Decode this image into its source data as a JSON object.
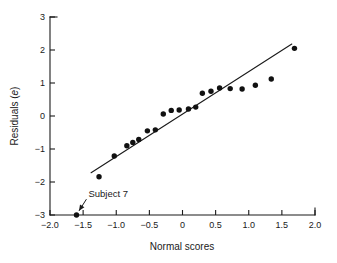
{
  "chart_data": {
    "type": "scatter",
    "title": "",
    "xlabel": "Normal scores",
    "ylabel": "Residuals (e)",
    "ylabel_plain": "Residuals (",
    "ylabel_italic": "e",
    "ylabel_close": ")",
    "xlim": [
      -2.0,
      2.0
    ],
    "ylim": [
      -3,
      3
    ],
    "grid": false,
    "legend": "none",
    "xticks": [
      -2.0,
      -1.5,
      -1.0,
      -0.5,
      0,
      0.5,
      1.0,
      1.5,
      2.0
    ],
    "xtick_labels": [
      "−2.0",
      "−1.5",
      "−1.0",
      "−0.5",
      "0",
      "0.5",
      "1.0",
      "1.5",
      "2.0"
    ],
    "yticks": [
      -3,
      -2,
      -1,
      0,
      1,
      2,
      3
    ],
    "ytick_labels": [
      "−3",
      "−2",
      "−1",
      "0",
      "1",
      "2",
      "3"
    ],
    "points": [
      {
        "x": -1.6,
        "y": -3.0
      },
      {
        "x": -1.26,
        "y": -1.84
      },
      {
        "x": -1.03,
        "y": -1.21
      },
      {
        "x": -0.84,
        "y": -0.9
      },
      {
        "x": -0.75,
        "y": -0.8
      },
      {
        "x": -0.66,
        "y": -0.71
      },
      {
        "x": -0.53,
        "y": -0.45
      },
      {
        "x": -0.41,
        "y": -0.42
      },
      {
        "x": -0.29,
        "y": 0.06
      },
      {
        "x": -0.17,
        "y": 0.17
      },
      {
        "x": -0.05,
        "y": 0.18
      },
      {
        "x": 0.09,
        "y": 0.21
      },
      {
        "x": 0.2,
        "y": 0.27
      },
      {
        "x": 0.3,
        "y": 0.69
      },
      {
        "x": 0.43,
        "y": 0.75
      },
      {
        "x": 0.56,
        "y": 0.85
      },
      {
        "x": 0.72,
        "y": 0.83
      },
      {
        "x": 0.9,
        "y": 0.82
      },
      {
        "x": 1.1,
        "y": 0.93
      },
      {
        "x": 1.34,
        "y": 1.12
      },
      {
        "x": 1.69,
        "y": 2.05
      }
    ],
    "fit_line": {
      "x_start": -1.38,
      "y_start": -1.72,
      "x_end": 1.65,
      "y_end": 2.18
    },
    "annotations": [
      {
        "text": "Subject 7",
        "text_x": -1.42,
        "text_y": -2.46,
        "target_x": -1.6,
        "target_y": -2.92
      }
    ]
  }
}
